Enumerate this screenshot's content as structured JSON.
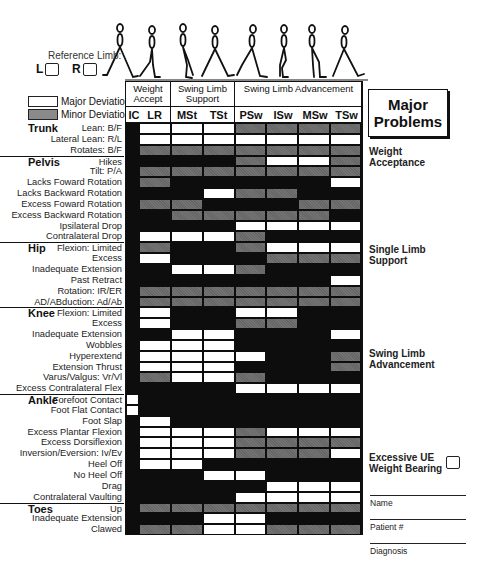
{
  "reference_limb": {
    "label": "Reference Limb:",
    "left": "L",
    "right": "R"
  },
  "legend": [
    {
      "label": "Major Deviation",
      "swatch": "white"
    },
    {
      "label": "Minor Deviation",
      "swatch": "gray"
    }
  ],
  "phase_groups": [
    {
      "label": "Weight Accept",
      "columns": [
        "IC",
        "LR"
      ]
    },
    {
      "label": "Swing Limb Support",
      "columns": [
        "MSt",
        "TSt"
      ]
    },
    {
      "label": "Swing Limb Advancement",
      "columns": [
        "PSw",
        "ISw",
        "MSw",
        "TSw"
      ]
    }
  ],
  "columns": [
    "IC",
    "LR",
    "MSt",
    "TSt",
    "PSw",
    "ISw",
    "MSw",
    "TSw"
  ],
  "colors": {
    "major": "#ffffff",
    "minor": "#6f6f6f",
    "none": "#0d0d0d"
  },
  "sections": [
    {
      "name": "Trunk",
      "rows": [
        {
          "label": "Lean: B/F",
          "cells": "bwwwgggg"
        },
        {
          "label": "Lateral Lean: R/L",
          "cells": "bwwwwwww"
        },
        {
          "label": "Rotates: B/F",
          "cells": "bggggggg"
        }
      ]
    },
    {
      "name": "Pelvis",
      "rows": [
        {
          "label": "Hikes",
          "cells": "bbbbgwwg"
        },
        {
          "label": "Tilt: P/A",
          "cells": "bggggggg"
        },
        {
          "label": "Lacks Foward Rotation",
          "cells": "bgbbbbbw"
        },
        {
          "label": "Lacks Backward Rotation",
          "cells": "bbbwggbb"
        },
        {
          "label": "Excess Foward Rotation",
          "cells": "bggbbbgg"
        },
        {
          "label": "Excess Backward Rotation",
          "cells": "bbgggggb"
        },
        {
          "label": "Ipsilateral Drop",
          "cells": "bbbbwwww"
        },
        {
          "label": "Contralateral Drop",
          "cells": "bwwwgbbb"
        }
      ]
    },
    {
      "name": "Hip",
      "rows": [
        {
          "label": "Flexion: Limited",
          "cells": "bgbbgwww"
        },
        {
          "label": "Excess",
          "cells": "bwbbbggg"
        },
        {
          "label": "Inadequate Extension",
          "cells": "bbwwgbbb",
          "ic_white": true
        },
        {
          "label": "Past Retract",
          "cells": "bbbbbbbw"
        },
        {
          "label": "Rotation: IR/ER",
          "cells": "bggggggg"
        },
        {
          "label": "AD/ABduction: Ad/Ab",
          "cells": "bggggggg"
        }
      ]
    },
    {
      "name": "Knee",
      "rows": [
        {
          "label": "Flexion: Limited",
          "cells": "bwbbwwbb"
        },
        {
          "label": "Excess",
          "cells": "bwbbggbb"
        },
        {
          "label": "Inadequate Extension",
          "cells": "bbwwbbbw"
        },
        {
          "label": "Wobbles",
          "cells": "bwwwbbbb"
        },
        {
          "label": "Hyperextend",
          "cells": "bwwwwbbg"
        },
        {
          "label": "Extension Thrust",
          "cells": "bwwwbbbg"
        },
        {
          "label": "Varus/Valgus: Vr/Vl",
          "cells": "bgwwgbbb"
        },
        {
          "label": "Excess Contralateral Flex",
          "cells": "bbbbwwww"
        }
      ]
    },
    {
      "name": "Ankle",
      "rows": [
        {
          "label": "Forefoot Contact",
          "cells": "wbbbbbbb"
        },
        {
          "label": "Foot Flat Contact",
          "cells": "wbbbbbbb"
        },
        {
          "label": "Foot Slap",
          "cells": "bwbbbbbb"
        },
        {
          "label": "Excess Plantar Flexion",
          "cells": "bwwwgwww"
        },
        {
          "label": "Excess Dorsiflexion",
          "cells": "bwwwgggg"
        },
        {
          "label": "Inversion/Eversion: Iv/Ev",
          "cells": "bwwwgggw"
        },
        {
          "label": "Heel Off",
          "cells": "bwwbbbbb"
        },
        {
          "label": "No Heel Off",
          "cells": "bbbwwbbb"
        },
        {
          "label": "Drag",
          "cells": "bbbbbwww"
        },
        {
          "label": "Contralateral Vaulting",
          "cells": "bbbbwwww"
        }
      ]
    },
    {
      "name": "Toes",
      "rows": [
        {
          "label": "Up",
          "cells": "bggggggg"
        },
        {
          "label": "Inadequate Extension",
          "cells": "bbbwwbbb"
        },
        {
          "label": "Clawed",
          "cells": "bggwwggg"
        }
      ]
    }
  ],
  "side_panel": {
    "title_line1": "Major",
    "title_line2": "Problems",
    "sections": [
      "Weight Acceptance",
      "Single Limb Support",
      "Swing Limb Advancement"
    ],
    "ue_label_line1": "Excessive UE",
    "ue_label_line2": "Weight Bearing",
    "fields": [
      "Name",
      "Patient #",
      "Diagnosis"
    ]
  }
}
